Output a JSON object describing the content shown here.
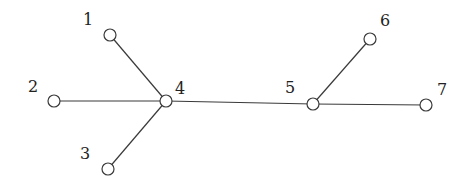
{
  "diagram": {
    "type": "tree-graph",
    "nodes": [
      {
        "id": "1",
        "label": "1",
        "x": 110,
        "y": 35,
        "lx": 88,
        "ly": 20
      },
      {
        "id": "2",
        "label": "2",
        "x": 54,
        "y": 101,
        "lx": 33,
        "ly": 87
      },
      {
        "id": "3",
        "label": "3",
        "x": 108,
        "y": 169,
        "lx": 85,
        "ly": 154
      },
      {
        "id": "4",
        "label": "4",
        "x": 166,
        "y": 101,
        "lx": 180,
        "ly": 89
      },
      {
        "id": "5",
        "label": "5",
        "x": 313,
        "y": 104,
        "lx": 290,
        "ly": 88
      },
      {
        "id": "6",
        "label": "6",
        "x": 370,
        "y": 39,
        "lx": 385,
        "ly": 21
      },
      {
        "id": "7",
        "label": "7",
        "x": 426,
        "y": 105,
        "lx": 442,
        "ly": 90
      }
    ],
    "edges": [
      [
        "1",
        "4"
      ],
      [
        "2",
        "4"
      ],
      [
        "3",
        "4"
      ],
      [
        "4",
        "5"
      ],
      [
        "5",
        "6"
      ],
      [
        "5",
        "7"
      ]
    ],
    "node_radius": 6,
    "stroke_color": "#3a3a3a"
  }
}
